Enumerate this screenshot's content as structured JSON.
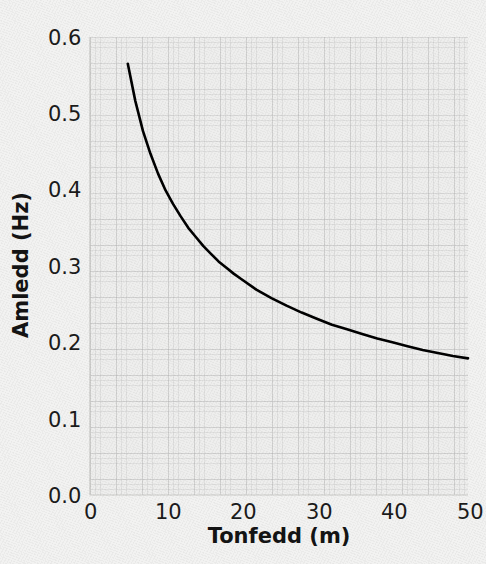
{
  "chart_data": {
    "type": "line",
    "title": "",
    "subtitle": "",
    "xlabel": "Tonfedd (m)",
    "ylabel": "Amledd (Hz)",
    "xlim": [
      0,
      50
    ],
    "ylim": [
      0.0,
      0.6
    ],
    "xticks": [
      "0",
      "10",
      "20",
      "30",
      "40",
      "50"
    ],
    "xtick_values": [
      0,
      10,
      20,
      30,
      40,
      50
    ],
    "yticks": [
      "0.0",
      "0.1",
      "0.2",
      "0.3",
      "0.4",
      "0.5",
      "0.6"
    ],
    "ytick_values": [
      0.0,
      0.1,
      0.2,
      0.3,
      0.4,
      0.5,
      0.6
    ],
    "grid": true,
    "legend": "none",
    "line_color": "#000000",
    "line_width": 2.6,
    "series": [
      {
        "name": "amledd",
        "x": [
          5,
          6,
          7,
          8,
          9,
          10,
          11,
          12,
          13,
          14,
          15,
          16,
          17,
          18,
          19,
          20,
          22,
          24,
          26,
          28,
          30,
          32,
          34,
          36,
          38,
          40,
          42,
          44,
          46,
          48,
          50
        ],
        "values": [
          0.565,
          0.516,
          0.477,
          0.447,
          0.421,
          0.399,
          0.381,
          0.365,
          0.35,
          0.338,
          0.326,
          0.316,
          0.306,
          0.298,
          0.29,
          0.283,
          0.269,
          0.258,
          0.248,
          0.239,
          0.231,
          0.223,
          0.217,
          0.211,
          0.205,
          0.2,
          0.195,
          0.19,
          0.186,
          0.182,
          0.179
        ]
      }
    ],
    "annotations": []
  },
  "axes": {
    "x_tick_labels": [
      "0",
      "10",
      "20",
      "30",
      "40",
      "50"
    ],
    "y_tick_labels": [
      "0.0",
      "0.1",
      "0.2",
      "0.3",
      "0.4",
      "0.5",
      "0.6"
    ],
    "x_title": "Tonfedd (m)",
    "y_title": "Amledd (Hz)"
  },
  "colors": {
    "background": "#f2f2f1",
    "plot_background": "#eeeeed",
    "line": "#000000",
    "text": "#1b1b1b",
    "grid": "#bfbfbf"
  }
}
